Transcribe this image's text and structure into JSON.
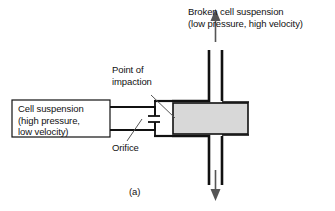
{
  "figure": {
    "caption": "(a)",
    "background_color": "#ffffff",
    "line_color": "#111111",
    "block_fill_color": "#d8d8d8",
    "labels": {
      "outlet": {
        "line1": "Broken cell suspension",
        "line2": "(low pressure, high velocity)"
      },
      "point_of_impaction": {
        "line1": "Point of",
        "line2": "impaction"
      },
      "inlet_box": {
        "line1": "Cell suspension",
        "line2": "(high pressure,",
        "line3": "low velocity)"
      },
      "orifice": "Orifice"
    },
    "icons": {
      "outlet_arrow_up": "arrow-up-icon",
      "outlet_arrow_down": "arrow-down-icon"
    }
  }
}
